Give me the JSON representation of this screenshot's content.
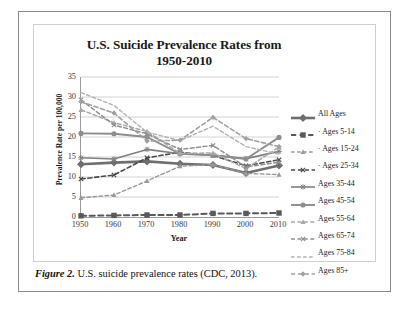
{
  "figure": {
    "caption_label": "Figure 2.",
    "caption_text": " U.S. suicide prevalence rates (CDC, 2013)."
  },
  "chart_data": {
    "type": "line",
    "title": "U.S. Suicide Prevalence Rates from 1950-2010",
    "title_line1": "U.S. Suicide Prevalence Rates from",
    "title_line2": "1950-2010",
    "xlabel": "Year",
    "ylabel": "Prevalence Rate per 100,000",
    "x": [
      1950,
      1960,
      1970,
      1980,
      1990,
      2000,
      2010
    ],
    "xticks": [
      "1950",
      "1960",
      "1970",
      "1980",
      "1990",
      "2000",
      "2010"
    ],
    "yticks": [
      "0",
      "5",
      "10",
      "15",
      "20",
      "25",
      "30",
      "35"
    ],
    "ylim": [
      0,
      35
    ],
    "xlim": [
      1950,
      2010
    ],
    "grid": "horizontal",
    "legend_position": "right",
    "series": [
      {
        "name": "All Ages",
        "marker": "diamond",
        "dash": "solid",
        "width": 2.6,
        "color": "#6f6f6f",
        "values": [
          13.2,
          13.6,
          13.9,
          13.3,
          13.0,
          11.0,
          12.9
        ]
      },
      {
        "name": "· Ages 5-14",
        "marker": "square",
        "dash": "dashed",
        "width": 2.0,
        "color": "#595959",
        "values": [
          0.3,
          0.4,
          0.5,
          0.5,
          0.9,
          0.9,
          1.0
        ]
      },
      {
        "name": "· Ages 15-24",
        "marker": "triangle",
        "dash": "dashed",
        "width": 1.4,
        "color": "#9a9a9a",
        "values": [
          4.8,
          5.5,
          9.0,
          12.7,
          13.1,
          10.9,
          10.6
        ]
      },
      {
        "name": "· Ages 25-34",
        "marker": "cross",
        "dash": "dashed",
        "width": 1.6,
        "color": "#4a4a4a",
        "values": [
          9.5,
          10.5,
          14.8,
          16.2,
          15.4,
          12.8,
          14.3
        ]
      },
      {
        "name": "Ages 35-44",
        "marker": "asterisk",
        "dash": "solid",
        "width": 1.6,
        "color": "#808080",
        "values": [
          14.8,
          14.5,
          16.9,
          15.8,
          15.5,
          14.6,
          16.4
        ]
      },
      {
        "name": "Ages 45-54",
        "marker": "circle",
        "dash": "solid",
        "width": 1.9,
        "color": "#8d8d8d",
        "values": [
          20.9,
          20.8,
          20.0,
          15.8,
          15.4,
          14.5,
          19.9
        ]
      },
      {
        "name": "Ages 55-64",
        "marker": "triangle",
        "dash": "dashed",
        "width": 1.5,
        "color": "#a8a8a8",
        "values": [
          26.8,
          23.6,
          21.4,
          15.9,
          16.0,
          12.1,
          17.5
        ]
      },
      {
        "name": "Ages 65-74",
        "marker": "cross",
        "dash": "dashed",
        "width": 1.5,
        "color": "#8f8f8f",
        "values": [
          29.3,
          23.0,
          20.8,
          16.9,
          17.9,
          12.5,
          13.7
        ]
      },
      {
        "name": "Ages 75-84",
        "marker": "none",
        "dash": "dashed",
        "width": 1.4,
        "color": "#b2b2b2",
        "values": [
          31.1,
          27.9,
          21.2,
          19.1,
          22.7,
          17.6,
          15.7
        ]
      },
      {
        "name": "Ages 85+",
        "marker": "diamond",
        "dash": "dashed",
        "width": 1.6,
        "color": "#a0a0a0",
        "values": [
          28.8,
          26.0,
          19.0,
          19.2,
          24.9,
          19.6,
          17.6
        ]
      }
    ]
  }
}
